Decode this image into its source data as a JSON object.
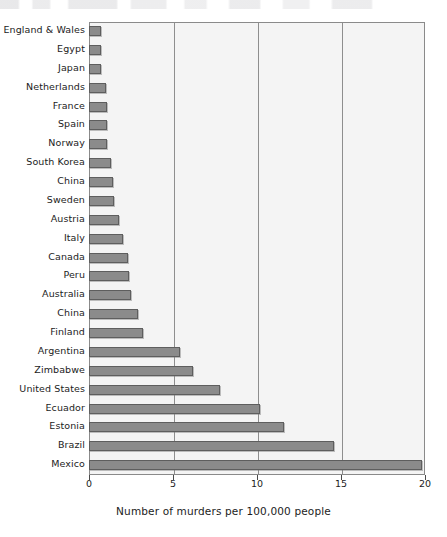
{
  "chart_data": {
    "type": "bar",
    "orientation": "horizontal",
    "title": "",
    "xlabel": "Number of murders per 100,000 people",
    "ylabel": "",
    "xlim": [
      0,
      20
    ],
    "xticks": [
      0,
      5,
      10,
      15,
      20
    ],
    "xticklabels": [
      "0",
      "5",
      "10",
      "15",
      "20"
    ],
    "gridlines": [
      5,
      10,
      15
    ],
    "grid": true,
    "legend": null,
    "bar_color": "#8b8b8b",
    "bar_edge_color": "#5e5e5e",
    "plot_background": "#f4f4f4",
    "plot_border_color": "#8a8a8a",
    "categories": [
      "England & Wales",
      "Egypt",
      "Japan",
      "Netherlands",
      "France",
      "Spain",
      "Norway",
      "South Korea",
      "China",
      "Sweden",
      "Austria",
      "Italy",
      "Canada",
      "Peru",
      "Australia",
      "China",
      "Finland",
      "Argentina",
      "Zimbabwe",
      "United States",
      "Ecuador",
      "Estonia",
      "Brazil",
      "Mexico"
    ],
    "values": [
      0.7,
      0.7,
      0.7,
      1.0,
      1.1,
      1.1,
      1.1,
      1.3,
      1.4,
      1.5,
      1.8,
      2.0,
      2.3,
      2.4,
      2.5,
      2.9,
      3.2,
      5.4,
      6.2,
      7.8,
      10.2,
      11.6,
      14.6,
      19.8
    ]
  }
}
